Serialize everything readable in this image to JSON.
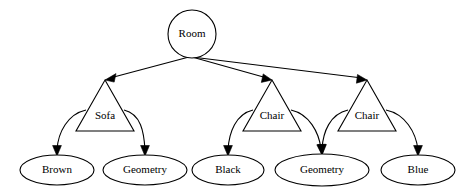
{
  "diagram": {
    "type": "tree",
    "background_color": "#ffffff",
    "stroke_color": "#000000",
    "text_color": "#000000",
    "nodes": [
      {
        "id": "root",
        "label": "Room",
        "shape": "circle",
        "cx": 192,
        "cy": 34,
        "rx": 24,
        "ry": 24,
        "level": 0
      },
      {
        "id": "sofa",
        "label": "Sofa",
        "shape": "triangle",
        "apex_x": 105,
        "apex_y": 80,
        "base_y": 131,
        "base_left_x": 76,
        "base_right_x": 134,
        "label_x": 105,
        "label_y": 116,
        "level": 1
      },
      {
        "id": "chair1",
        "label": "Chair",
        "shape": "triangle",
        "apex_x": 272,
        "apex_y": 80,
        "base_y": 131,
        "base_left_x": 243,
        "base_right_x": 301,
        "label_x": 272,
        "label_y": 116,
        "level": 1
      },
      {
        "id": "chair2",
        "label": "Chair",
        "shape": "triangle",
        "apex_x": 367,
        "apex_y": 80,
        "base_y": 131,
        "base_left_x": 338,
        "base_right_x": 396,
        "label_x": 367,
        "label_y": 116,
        "level": 1
      },
      {
        "id": "brown",
        "label": "Brown",
        "shape": "ellipse",
        "cx": 57,
        "cy": 170,
        "rx": 37,
        "ry": 15,
        "level": 2
      },
      {
        "id": "geometry1",
        "label": "Geometry",
        "shape": "ellipse",
        "cx": 145,
        "cy": 170,
        "rx": 42,
        "ry": 15,
        "level": 2
      },
      {
        "id": "black",
        "label": "Black",
        "shape": "ellipse",
        "cx": 228,
        "cy": 170,
        "rx": 36,
        "ry": 15,
        "level": 2
      },
      {
        "id": "geometry2",
        "label": "Geometry",
        "shape": "ellipse",
        "cx": 322,
        "cy": 170,
        "rx": 47,
        "ry": 16,
        "level": 2
      },
      {
        "id": "blue",
        "label": "Blue",
        "shape": "ellipse",
        "cx": 418,
        "cy": 170,
        "rx": 37,
        "ry": 15,
        "level": 2
      }
    ],
    "edges": [
      {
        "from": "root",
        "to": "sofa",
        "style": "straight",
        "arrow": true
      },
      {
        "from": "root",
        "to": "chair1",
        "style": "straight",
        "arrow": true
      },
      {
        "from": "root",
        "to": "chair2",
        "style": "straight",
        "arrow": true
      },
      {
        "from": "sofa",
        "to": "brown",
        "style": "curved",
        "arrow": true
      },
      {
        "from": "sofa",
        "to": "geometry1",
        "style": "curved",
        "arrow": true
      },
      {
        "from": "chair1",
        "to": "black",
        "style": "curved",
        "arrow": true
      },
      {
        "from": "chair1",
        "to": "geometry2",
        "style": "curved",
        "arrow": true
      },
      {
        "from": "chair2",
        "to": "geometry2",
        "style": "curved",
        "arrow": true
      },
      {
        "from": "chair2",
        "to": "blue",
        "style": "curved",
        "arrow": true
      }
    ]
  },
  "labels": {
    "root": "Room",
    "sofa": "Sofa",
    "chair1": "Chair",
    "chair2": "Chair",
    "brown": "Brown",
    "geometry1": "Geometry",
    "black": "Black",
    "geometry2": "Geometry",
    "blue": "Blue"
  }
}
